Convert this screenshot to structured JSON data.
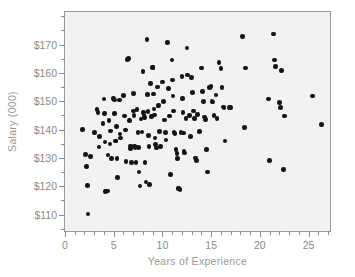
{
  "chart_data": {
    "type": "scatter",
    "title": "",
    "xlabel": "Years of Experience",
    "ylabel": "Salary (000)",
    "xlim": [
      0,
      27.4
    ],
    "ylim": [
      103.5,
      181.5
    ],
    "grid": false,
    "legend": null,
    "x_ticks": [
      0,
      5,
      10,
      15,
      20,
      25
    ],
    "x_tick_labels": [
      "0",
      "5",
      "10",
      "15",
      "20",
      "25"
    ],
    "x_minor_ticks": [
      1,
      2,
      3,
      4,
      6,
      7,
      8,
      9,
      11,
      12,
      13,
      14,
      16,
      17,
      18,
      19,
      21,
      22,
      23,
      24,
      26,
      27
    ],
    "y_ticks": [
      110,
      120,
      130,
      140,
      150,
      160,
      170
    ],
    "y_tick_labels": [
      "$110",
      "$120",
      "$130",
      "$140",
      "$150",
      "$160",
      "$170"
    ],
    "y_minor_ticks": [
      105,
      115,
      125,
      135,
      145,
      155,
      165,
      175,
      180
    ],
    "point_color": "#141414",
    "plot_background": "#f2f2f2",
    "axis_color": "#9a9a9a",
    "label_color": "#8a8a8a",
    "series": [
      {
        "name": "employees",
        "points": [
          [
            1.8,
            140.0
          ],
          [
            2.1,
            131.2
          ],
          [
            2.2,
            127.0
          ],
          [
            2.3,
            120.3
          ],
          [
            2.35,
            110.2
          ],
          [
            2.6,
            130.5
          ],
          [
            3.0,
            139.0
          ],
          [
            3.3,
            147.0
          ],
          [
            3.4,
            146.0
          ],
          [
            3.5,
            133.8
          ],
          [
            3.55,
            137.5
          ],
          [
            3.9,
            142.2
          ],
          [
            4.0,
            150.8
          ],
          [
            4.05,
            145.6
          ],
          [
            4.1,
            135.6
          ],
          [
            4.15,
            118.2
          ],
          [
            4.35,
            118.3
          ],
          [
            4.4,
            131.0
          ],
          [
            4.5,
            143.2
          ],
          [
            4.6,
            134.9
          ],
          [
            4.65,
            139.5
          ],
          [
            4.8,
            129.8
          ],
          [
            5.0,
            151.0
          ],
          [
            5.05,
            150.4
          ],
          [
            5.1,
            145.6
          ],
          [
            5.2,
            136.0
          ],
          [
            5.25,
            135.9
          ],
          [
            5.3,
            141.0
          ],
          [
            5.35,
            129.7
          ],
          [
            5.4,
            123.0
          ],
          [
            5.6,
            150.5
          ],
          [
            5.65,
            138.4
          ],
          [
            5.7,
            137.0
          ],
          [
            6.0,
            152.0
          ],
          [
            6.1,
            144.8
          ],
          [
            6.2,
            139.8
          ],
          [
            6.25,
            128.7
          ],
          [
            6.4,
            164.8
          ],
          [
            6.5,
            165.0
          ],
          [
            6.6,
            143.3
          ],
          [
            6.7,
            134.2
          ],
          [
            6.75,
            133.4
          ],
          [
            6.8,
            128.4
          ],
          [
            7.0,
            152.8
          ],
          [
            7.05,
            146.5
          ],
          [
            7.1,
            145.0
          ],
          [
            7.15,
            134.2
          ],
          [
            7.2,
            133.6
          ],
          [
            7.3,
            128.4
          ],
          [
            7.4,
            147.0
          ],
          [
            7.5,
            139.0
          ],
          [
            7.55,
            133.7
          ],
          [
            7.6,
            125.0
          ],
          [
            7.7,
            120.1
          ],
          [
            7.8,
            143.8
          ],
          [
            7.9,
            139.2
          ],
          [
            8.0,
            160.5
          ],
          [
            8.05,
            146.0
          ],
          [
            8.1,
            145.2
          ],
          [
            8.15,
            144.3
          ],
          [
            8.2,
            128.3
          ],
          [
            8.3,
            121.5
          ],
          [
            8.4,
            171.8
          ],
          [
            8.45,
            152.3
          ],
          [
            8.5,
            146.4
          ],
          [
            8.55,
            138.0
          ],
          [
            8.6,
            134.0
          ],
          [
            8.7,
            120.7
          ],
          [
            8.8,
            156.2
          ],
          [
            8.9,
            144.6
          ],
          [
            9.0,
            162.0
          ],
          [
            9.05,
            161.9
          ],
          [
            9.1,
            152.6
          ],
          [
            9.15,
            147.2
          ],
          [
            9.2,
            145.2
          ],
          [
            9.25,
            137.0
          ],
          [
            9.3,
            134.7
          ],
          [
            9.4,
            133.5
          ],
          [
            9.5,
            155.0
          ],
          [
            9.55,
            148.3
          ],
          [
            9.6,
            148.4
          ],
          [
            9.7,
            139.3
          ],
          [
            9.8,
            134.0
          ],
          [
            10.0,
            156.8
          ],
          [
            10.1,
            150.0
          ],
          [
            10.2,
            143.4
          ],
          [
            10.3,
            139.0
          ],
          [
            10.35,
            136.3
          ],
          [
            10.5,
            170.8
          ],
          [
            10.6,
            154.4
          ],
          [
            10.7,
            144.8
          ],
          [
            10.8,
            124.2
          ],
          [
            11.0,
            164.5
          ],
          [
            11.05,
            157.5
          ],
          [
            11.1,
            151.8
          ],
          [
            11.15,
            146.5
          ],
          [
            11.2,
            138.9
          ],
          [
            11.3,
            138.7
          ],
          [
            11.4,
            132.9
          ],
          [
            11.5,
            131.6
          ],
          [
            11.55,
            129.8
          ],
          [
            11.6,
            119.3
          ],
          [
            11.7,
            119.2
          ],
          [
            11.8,
            118.8
          ],
          [
            11.9,
            139.0
          ],
          [
            12.0,
            158.8
          ],
          [
            12.05,
            151.0
          ],
          [
            12.1,
            146.0
          ],
          [
            12.15,
            138.8
          ],
          [
            12.2,
            132.5
          ],
          [
            12.25,
            131.8
          ],
          [
            12.4,
            143.9
          ],
          [
            12.5,
            168.8
          ],
          [
            12.6,
            159.2
          ],
          [
            12.8,
            145.0
          ],
          [
            12.9,
            137.5
          ],
          [
            13.0,
            158.3
          ],
          [
            13.1,
            153.0
          ],
          [
            13.2,
            146.6
          ],
          [
            13.3,
            144.0
          ],
          [
            13.4,
            130.0
          ],
          [
            13.5,
            129.0
          ],
          [
            13.6,
            145.4
          ],
          [
            13.8,
            139.4
          ],
          [
            14.0,
            161.8
          ],
          [
            14.1,
            153.4
          ],
          [
            14.2,
            150.0
          ],
          [
            14.3,
            144.5
          ],
          [
            14.4,
            143.6
          ],
          [
            14.5,
            133.0
          ],
          [
            14.6,
            125.0
          ],
          [
            14.8,
            154.8
          ],
          [
            15.0,
            155.2
          ],
          [
            15.1,
            150.0
          ],
          [
            15.2,
            149.8
          ],
          [
            15.3,
            145.0
          ],
          [
            15.5,
            152.2
          ],
          [
            15.6,
            144.0
          ],
          [
            15.8,
            163.7
          ],
          [
            16.0,
            161.5
          ],
          [
            16.1,
            154.8
          ],
          [
            16.2,
            148.0
          ],
          [
            16.3,
            147.8
          ],
          [
            16.4,
            136.0
          ],
          [
            16.9,
            147.8
          ],
          [
            17.0,
            147.8
          ],
          [
            18.2,
            172.8
          ],
          [
            18.4,
            140.8
          ],
          [
            18.5,
            161.8
          ],
          [
            20.9,
            150.8
          ],
          [
            21.0,
            129.0
          ],
          [
            21.4,
            173.8
          ],
          [
            21.5,
            164.5
          ],
          [
            21.6,
            162.2
          ],
          [
            22.0,
            149.6
          ],
          [
            22.1,
            147.8
          ],
          [
            22.2,
            160.8
          ],
          [
            22.4,
            126.0
          ],
          [
            22.5,
            144.8
          ],
          [
            25.4,
            151.8
          ],
          [
            26.3,
            141.7
          ]
        ]
      }
    ]
  }
}
